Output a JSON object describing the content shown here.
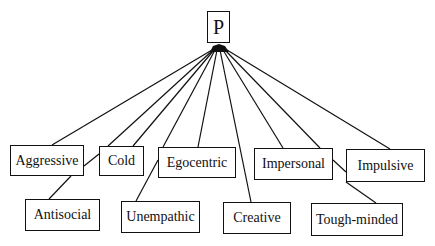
{
  "diagram": {
    "type": "hierarchy",
    "root": {
      "id": "P",
      "label": "P"
    },
    "traits": [
      {
        "id": "aggressive",
        "label": "Aggressive",
        "row": 1
      },
      {
        "id": "cold",
        "label": "Cold",
        "row": 1
      },
      {
        "id": "egocentric",
        "label": "Egocentric",
        "row": 1
      },
      {
        "id": "impersonal",
        "label": "Impersonal",
        "row": 1
      },
      {
        "id": "impulsive",
        "label": "Impulsive",
        "row": 1
      },
      {
        "id": "antisocial",
        "label": "Antisocial",
        "row": 2
      },
      {
        "id": "unempathic",
        "label": "Unempathic",
        "row": 2
      },
      {
        "id": "creative",
        "label": "Creative",
        "row": 2
      },
      {
        "id": "tough_minded",
        "label": "Tough-minded",
        "row": 2
      }
    ],
    "edges": [
      [
        "P",
        "aggressive"
      ],
      [
        "P",
        "cold"
      ],
      [
        "P",
        "egocentric"
      ],
      [
        "P",
        "impersonal"
      ],
      [
        "P",
        "impulsive"
      ],
      [
        "P",
        "antisocial"
      ],
      [
        "P",
        "unempathic"
      ],
      [
        "P",
        "creative"
      ],
      [
        "P",
        "tough_minded"
      ]
    ],
    "colors": {
      "line": "#111111",
      "background": "#ffffff"
    }
  }
}
